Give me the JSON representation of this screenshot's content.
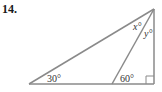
{
  "problem": {
    "number": "14."
  },
  "diagram": {
    "angles": {
      "bottom_left": "30°",
      "inner_base": "60°",
      "apex_left": "x°",
      "apex_right": "y°"
    },
    "right_angle_marker": true,
    "stroke_color": "#8a8a8a"
  }
}
